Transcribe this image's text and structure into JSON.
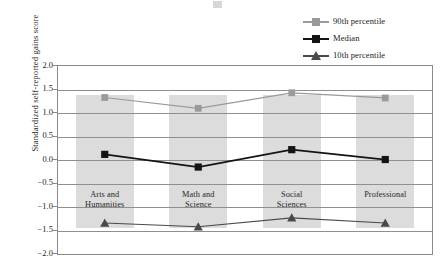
{
  "chart_data": {
    "type": "line",
    "title": "",
    "xlabel": "",
    "ylabel": "Standardized self-reported gains score",
    "ylim": [
      -2.0,
      2.0
    ],
    "ytick_labels": [
      "2.0",
      "1.5",
      "1.0",
      "0.5",
      "0.0",
      "-0.5",
      "-1.0",
      "-1.5",
      "-2.0"
    ],
    "ytick_values": [
      2.0,
      1.5,
      1.0,
      0.5,
      0.0,
      -0.5,
      -1.0,
      -1.5,
      -2.0
    ],
    "grid": true,
    "legend_position": "top-right",
    "categories": [
      "Arts and Humanities",
      "Math and Science",
      "Social Sciences",
      "Professional"
    ],
    "category_lines": [
      [
        "Arts and",
        "Humanities"
      ],
      [
        "Math and",
        "Science"
      ],
      [
        "Social",
        "Sciences"
      ],
      [
        "Professional"
      ]
    ],
    "series": [
      {
        "name": "90th percentile",
        "values": [
          1.33,
          1.1,
          1.43,
          1.32
        ],
        "color": "#9a9a9a",
        "marker": "square"
      },
      {
        "name": "Median",
        "values": [
          0.12,
          -0.15,
          0.22,
          0.01
        ],
        "color": "#141414",
        "marker": "square"
      },
      {
        "name": "10th percentile",
        "values": [
          -1.34,
          -1.42,
          -1.23,
          -1.34
        ],
        "color": "#4a4a4a",
        "marker": "triangle"
      }
    ],
    "band_color": "#dcdcdc",
    "grid_color": "#8f8f8f",
    "frame_color": "#8a8a8a"
  },
  "legend": {
    "items": [
      {
        "label": "90th percentile"
      },
      {
        "label": "Median"
      },
      {
        "label": "10th percentile"
      }
    ]
  }
}
